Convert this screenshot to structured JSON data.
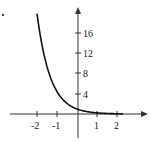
{
  "chart_data": {
    "type": "line",
    "title": "",
    "xlabel": "",
    "ylabel": "",
    "function": "exponential decay, y ≈ e^(-1.5x) (passes through (0,1))",
    "xlim": [
      -2.1,
      2.3
    ],
    "ylim": [
      -4,
      21
    ],
    "x_ticks": [
      -2,
      -1,
      1,
      2
    ],
    "x_tick_labels": [
      "-2",
      "-1",
      "1",
      "2"
    ],
    "y_ticks": [
      4,
      8,
      12,
      16
    ],
    "y_tick_labels": [
      "4",
      "8",
      "12",
      "16"
    ],
    "grid": false,
    "legend": null,
    "series": [
      {
        "name": "curve",
        "x": [
          -2,
          -1.5,
          -1,
          -0.5,
          0,
          0.5,
          1,
          1.5,
          2,
          2.3
        ],
        "y": [
          20.1,
          9.5,
          4.5,
          2.1,
          1.0,
          0.47,
          0.22,
          0.11,
          0.05,
          0.03
        ]
      }
    ],
    "colors": {
      "curve": "#111111",
      "axes": "#333333"
    }
  },
  "labels": {
    "x": [
      "-2",
      "-1",
      "1",
      "2"
    ],
    "y": [
      "16",
      "12",
      "8",
      "4"
    ]
  }
}
